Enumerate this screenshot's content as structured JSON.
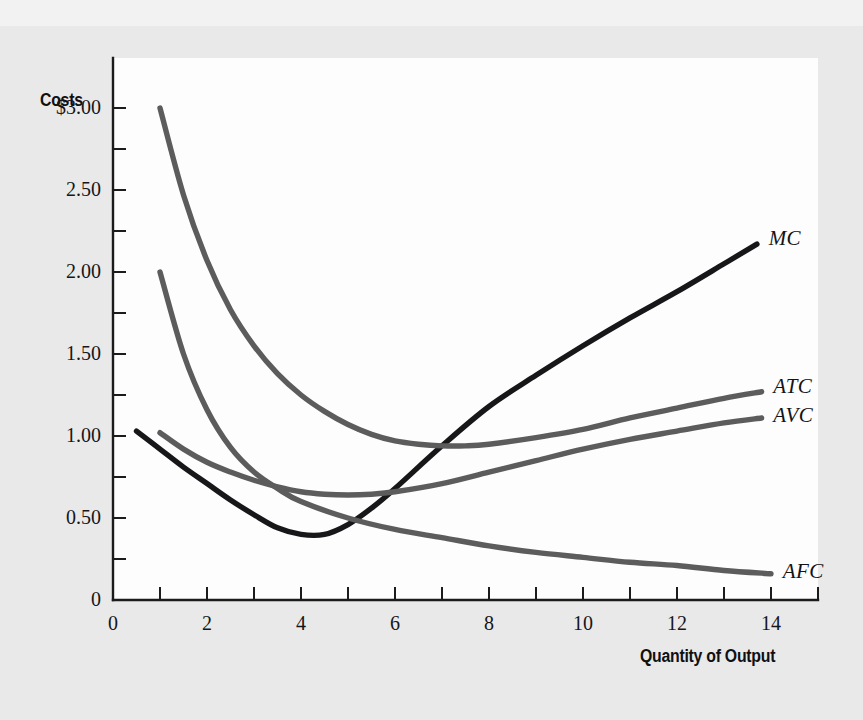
{
  "figure": {
    "background_color": "#e9e9e9",
    "panel_color": "#fdfdfd",
    "y_axis_title": "Costs",
    "x_axis_title": "Quantity of Output"
  },
  "chart_data": {
    "type": "line",
    "title": "",
    "subtitle": "",
    "xlabel": "Quantity of Output",
    "ylabel": "Costs",
    "xlim": [
      0,
      15
    ],
    "ylim": [
      0,
      3.3
    ],
    "grid": false,
    "legend_position": "right-of-curve-ends",
    "x_ticks_major": [
      "0",
      "2",
      "4",
      "6",
      "8",
      "10",
      "12",
      "14"
    ],
    "x_ticks_major_values": [
      0,
      2,
      4,
      6,
      8,
      10,
      12,
      14
    ],
    "x_ticks_minor_values": [
      1,
      3,
      5,
      7,
      9,
      11,
      13,
      15
    ],
    "y_ticks_major": [
      "0",
      "0.50",
      "1.00",
      "1.50",
      "2.00",
      "2.50",
      "$3.00"
    ],
    "y_ticks_major_values": [
      0,
      0.5,
      1.0,
      1.5,
      2.0,
      2.5,
      3.0
    ],
    "y_ticks_minor_values": [
      0.25,
      0.75,
      1.25,
      1.75,
      2.25,
      2.75
    ],
    "series": [
      {
        "name": "MC",
        "label": "MC",
        "color": "#17171a",
        "x": [
          0.5,
          1.0,
          1.5,
          2.0,
          2.5,
          3.0,
          3.5,
          4.0,
          4.5,
          5.0,
          5.5,
          6.0,
          7.0,
          8.0,
          9.0,
          10.0,
          11.0,
          12.0,
          13.0,
          13.7
        ],
        "values": [
          1.03,
          0.92,
          0.81,
          0.71,
          0.61,
          0.52,
          0.44,
          0.4,
          0.4,
          0.46,
          0.56,
          0.68,
          0.94,
          1.18,
          1.37,
          1.55,
          1.72,
          1.88,
          2.05,
          2.17
        ]
      },
      {
        "name": "ATC",
        "label": "ATC",
        "color": "#5c5c5c",
        "x": [
          1.0,
          1.5,
          2.0,
          2.5,
          3.0,
          3.5,
          4.0,
          4.5,
          5.0,
          5.5,
          6.0,
          6.5,
          7.0,
          7.5,
          8.0,
          9.0,
          10.0,
          11.0,
          12.0,
          13.0,
          13.8
        ],
        "values": [
          3.0,
          2.47,
          2.07,
          1.77,
          1.55,
          1.38,
          1.25,
          1.15,
          1.07,
          1.01,
          0.97,
          0.95,
          0.94,
          0.94,
          0.95,
          0.99,
          1.04,
          1.11,
          1.17,
          1.23,
          1.27
        ]
      },
      {
        "name": "AVC",
        "label": "AVC",
        "color": "#5c5c5c",
        "x": [
          1.0,
          1.5,
          2.0,
          2.5,
          3.0,
          3.5,
          4.0,
          4.5,
          5.0,
          5.5,
          6.0,
          7.0,
          8.0,
          9.0,
          10.0,
          11.0,
          12.0,
          13.0,
          13.8
        ],
        "values": [
          1.02,
          0.92,
          0.84,
          0.78,
          0.73,
          0.69,
          0.66,
          0.645,
          0.64,
          0.645,
          0.66,
          0.71,
          0.78,
          0.85,
          0.92,
          0.98,
          1.03,
          1.08,
          1.11
        ]
      },
      {
        "name": "AFC",
        "label": "AFC",
        "color": "#5c5c5c",
        "x": [
          1.0,
          1.5,
          2.0,
          2.5,
          3.0,
          3.5,
          4.0,
          5.0,
          6.0,
          7.0,
          8.0,
          9.0,
          10.0,
          11.0,
          12.0,
          13.0,
          14.0
        ],
        "values": [
          2.0,
          1.5,
          1.16,
          0.93,
          0.78,
          0.68,
          0.6,
          0.5,
          0.43,
          0.38,
          0.33,
          0.29,
          0.26,
          0.23,
          0.21,
          0.18,
          0.16
        ]
      }
    ],
    "curve_labels": [
      {
        "text": "MC",
        "x": 13.95,
        "y": 2.2
      },
      {
        "text": "ATC",
        "x": 14.05,
        "y": 1.3
      },
      {
        "text": "AVC",
        "x": 14.05,
        "y": 1.12
      },
      {
        "text": "AFC",
        "x": 14.25,
        "y": 0.17
      }
    ]
  }
}
